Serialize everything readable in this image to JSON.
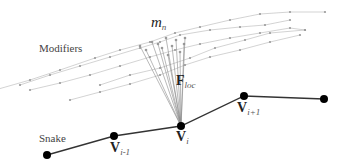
{
  "diagram": {
    "labels": {
      "modifiers": "Modifiers",
      "modifier_name": "m",
      "modifier_sub": "n",
      "force": "F",
      "force_sub": "loc",
      "snake": "Snake",
      "v_prev": "V",
      "v_prev_sub": "i-1",
      "v_cur": "V",
      "v_cur_sub": "i",
      "v_next": "V",
      "v_next_sub": "i+1"
    },
    "colors": {
      "snake_line": "#333333",
      "snake_node": "#000000",
      "modifier_line": "#c8c8c8",
      "modifier_dot": "#9a9a9a",
      "force_line": "#8a8a8a"
    },
    "snake_nodes": [
      [
        47,
        155
      ],
      [
        114,
        136
      ],
      [
        181,
        126
      ],
      [
        244,
        96
      ],
      [
        324,
        99
      ]
    ],
    "modifier_curves": [
      [
        [
          -5,
          90
        ],
        [
          30,
          80
        ],
        [
          60,
          70
        ],
        [
          95,
          58
        ],
        [
          120,
          50
        ],
        [
          150,
          42
        ],
        [
          175,
          33
        ],
        [
          200,
          27
        ],
        [
          230,
          20
        ],
        [
          260,
          14
        ],
        [
          290,
          12
        ],
        [
          325,
          12
        ]
      ],
      [
        [
          20,
          85
        ],
        [
          50,
          75
        ],
        [
          80,
          66
        ],
        [
          110,
          57
        ],
        [
          140,
          48
        ],
        [
          160,
          42
        ],
        [
          180,
          35
        ],
        [
          210,
          30
        ],
        [
          240,
          27
        ],
        [
          265,
          25
        ],
        [
          290,
          20
        ]
      ],
      [
        [
          30,
          90
        ],
        [
          60,
          83
        ],
        [
          90,
          75
        ],
        [
          120,
          66
        ],
        [
          150,
          57
        ],
        [
          175,
          50
        ],
        [
          200,
          44
        ],
        [
          230,
          38
        ],
        [
          260,
          33
        ],
        [
          290,
          28
        ],
        [
          305,
          30
        ]
      ],
      [
        [
          70,
          100
        ],
        [
          100,
          92
        ],
        [
          130,
          84
        ],
        [
          160,
          75
        ],
        [
          185,
          65
        ],
        [
          210,
          57
        ],
        [
          240,
          50
        ],
        [
          270,
          42
        ],
        [
          300,
          35
        ]
      ],
      [
        [
          100,
          85
        ],
        [
          130,
          75
        ],
        [
          160,
          68
        ],
        [
          190,
          58
        ],
        [
          215,
          48
        ],
        [
          245,
          40
        ],
        [
          270,
          33
        ],
        [
          305,
          30
        ]
      ]
    ],
    "force_sources": [
      [
        140,
        46
      ],
      [
        146,
        50
      ],
      [
        152,
        42
      ],
      [
        158,
        44
      ],
      [
        162,
        48
      ],
      [
        166,
        38
      ],
      [
        168,
        55
      ],
      [
        172,
        46
      ],
      [
        176,
        40
      ],
      [
        180,
        52
      ],
      [
        184,
        44
      ],
      [
        185,
        38
      ]
    ],
    "force_target": [
      181,
      126
    ]
  }
}
